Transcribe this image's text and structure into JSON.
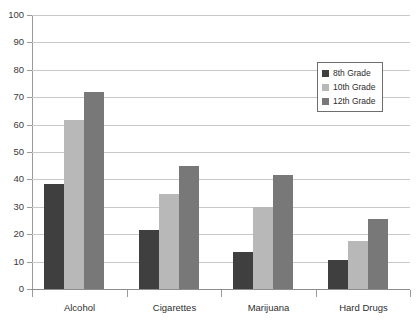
{
  "chart_data": {
    "type": "bar",
    "title": "",
    "subtitle": "",
    "xlabel": "",
    "ylabel": "",
    "ylim": [
      0,
      100
    ],
    "ytick_step": 10,
    "yticks": [
      100,
      90,
      80,
      70,
      60,
      50,
      40,
      30,
      20,
      10,
      0
    ],
    "grid": true,
    "legend_position": "upper-right",
    "categories": [
      "Alcohol",
      "Cigarettes",
      "Marijuana",
      "Hard Drugs"
    ],
    "series": [
      {
        "name": "8th Grade",
        "color": "#3f3f3f",
        "values": [
          38.5,
          21.5,
          13.5,
          10.5
        ]
      },
      {
        "name": "10th Grade",
        "color": "#b8b8b8",
        "values": [
          61.5,
          34.5,
          30,
          17.5
        ]
      },
      {
        "name": "12th Grade",
        "color": "#787878",
        "values": [
          72,
          45,
          41.5,
          25.5
        ]
      }
    ]
  }
}
